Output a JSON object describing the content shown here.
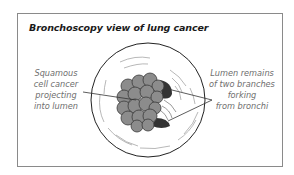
{
  "title": "Bronchoscopy view of lung cancer",
  "labels": {
    "left": {
      "lines": [
        "Squamous",
        "cell cancer",
        "projecting",
        "into lumen"
      ]
    },
    "right": {
      "lines": [
        "Lumen remains",
        "of two branches",
        "forking",
        "from bronchi"
      ]
    }
  },
  "colors": {
    "frame": "#8a8a8a",
    "title": "#1a1a1a",
    "label_text": "#6e6e6e",
    "tumor": "#8c8c8c",
    "outline": "#222222"
  }
}
